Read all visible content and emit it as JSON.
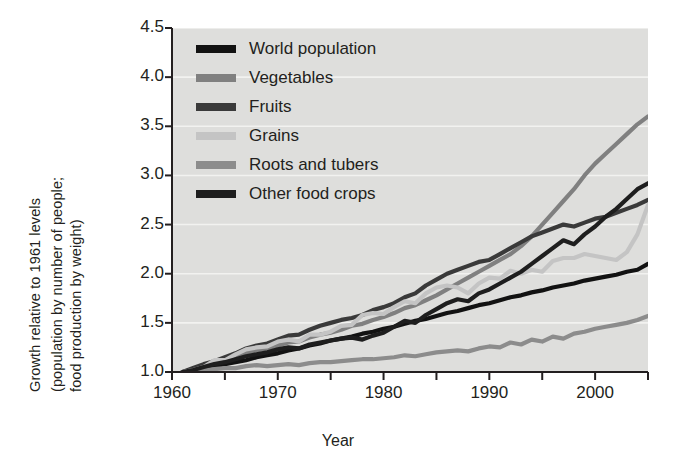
{
  "chart_data": {
    "type": "line",
    "title": "",
    "xlabel": "Year",
    "ylabel": "Growth relative to 1961 levels (population by number of people; food production by weight)",
    "ylabel_lines": [
      "Growth relative to 1961 levels",
      "(population by number of people;",
      "food production by weight)"
    ],
    "xlim": [
      1960,
      2005
    ],
    "ylim": [
      1.0,
      4.5
    ],
    "xticks": [
      1960,
      1970,
      1980,
      1990,
      2000
    ],
    "xtick_labels": [
      "1960",
      "1970",
      "1980",
      "1990",
      "2000"
    ],
    "xminor_ticks": [
      1965,
      1975,
      1985,
      1995,
      2005
    ],
    "yticks": [
      1.0,
      1.5,
      2.0,
      2.5,
      3.0,
      3.5,
      4.0,
      4.5
    ],
    "ytick_labels": [
      "1.0",
      "1.5",
      "2.0",
      "2.5",
      "3.0",
      "3.5",
      "4.0",
      "4.5"
    ],
    "grid": "horizontal-white",
    "legend_position": "top-left-inside",
    "plot_background": "#dededc",
    "x": [
      1961,
      1962,
      1963,
      1964,
      1965,
      1966,
      1967,
      1968,
      1969,
      1970,
      1971,
      1972,
      1973,
      1974,
      1975,
      1976,
      1977,
      1978,
      1979,
      1980,
      1981,
      1982,
      1983,
      1984,
      1985,
      1986,
      1987,
      1988,
      1989,
      1990,
      1991,
      1992,
      1993,
      1994,
      1995,
      1996,
      1997,
      1998,
      1999,
      2000,
      2001,
      2002,
      2003,
      2004,
      2005
    ],
    "series": [
      {
        "name": "World population",
        "color": "#121212",
        "values": [
          1.0,
          1.02,
          1.04,
          1.06,
          1.08,
          1.1,
          1.12,
          1.15,
          1.17,
          1.19,
          1.22,
          1.24,
          1.27,
          1.29,
          1.32,
          1.34,
          1.36,
          1.39,
          1.41,
          1.44,
          1.46,
          1.49,
          1.52,
          1.54,
          1.57,
          1.6,
          1.62,
          1.65,
          1.68,
          1.7,
          1.73,
          1.76,
          1.78,
          1.81,
          1.83,
          1.86,
          1.88,
          1.9,
          1.93,
          1.95,
          1.97,
          1.99,
          2.02,
          2.04,
          2.1
        ]
      },
      {
        "name": "Vegetables",
        "color": "#808080",
        "values": [
          1.0,
          1.03,
          1.06,
          1.1,
          1.13,
          1.15,
          1.2,
          1.22,
          1.24,
          1.27,
          1.3,
          1.31,
          1.35,
          1.38,
          1.4,
          1.43,
          1.47,
          1.49,
          1.53,
          1.56,
          1.6,
          1.65,
          1.68,
          1.73,
          1.78,
          1.84,
          1.9,
          1.96,
          2.02,
          2.08,
          2.14,
          2.2,
          2.28,
          2.38,
          2.5,
          2.62,
          2.74,
          2.86,
          3.0,
          3.12,
          3.22,
          3.32,
          3.42,
          3.52,
          3.6
        ]
      },
      {
        "name": "Fruits",
        "color": "#3a3a3a",
        "values": [
          1.0,
          1.04,
          1.08,
          1.11,
          1.15,
          1.19,
          1.24,
          1.27,
          1.29,
          1.33,
          1.37,
          1.38,
          1.43,
          1.47,
          1.5,
          1.53,
          1.55,
          1.58,
          1.63,
          1.66,
          1.7,
          1.76,
          1.8,
          1.88,
          1.94,
          2.0,
          2.04,
          2.08,
          2.12,
          2.14,
          2.2,
          2.26,
          2.32,
          2.38,
          2.42,
          2.46,
          2.5,
          2.48,
          2.52,
          2.56,
          2.58,
          2.62,
          2.66,
          2.7,
          2.75
        ]
      },
      {
        "name": "Grains",
        "color": "#c4c4c4",
        "values": [
          1.0,
          1.02,
          1.05,
          1.12,
          1.12,
          1.18,
          1.23,
          1.25,
          1.26,
          1.31,
          1.33,
          1.31,
          1.38,
          1.38,
          1.41,
          1.47,
          1.48,
          1.58,
          1.6,
          1.59,
          1.66,
          1.72,
          1.7,
          1.8,
          1.86,
          1.88,
          1.86,
          1.8,
          1.9,
          1.96,
          1.95,
          2.03,
          2.0,
          2.04,
          2.02,
          2.13,
          2.16,
          2.16,
          2.2,
          2.18,
          2.16,
          2.14,
          2.22,
          2.4,
          2.7
        ]
      },
      {
        "name": "Roots and tubers",
        "color": "#8c8c8c",
        "values": [
          1.0,
          1.01,
          1.02,
          1.03,
          1.04,
          1.04,
          1.06,
          1.07,
          1.06,
          1.07,
          1.08,
          1.07,
          1.09,
          1.1,
          1.1,
          1.11,
          1.12,
          1.13,
          1.13,
          1.14,
          1.15,
          1.17,
          1.16,
          1.18,
          1.2,
          1.21,
          1.22,
          1.21,
          1.24,
          1.26,
          1.25,
          1.3,
          1.28,
          1.33,
          1.31,
          1.36,
          1.34,
          1.39,
          1.41,
          1.44,
          1.46,
          1.48,
          1.5,
          1.53,
          1.57
        ]
      },
      {
        "name": "Other food crops",
        "color": "#1e1e1e",
        "values": [
          1.0,
          1.02,
          1.05,
          1.08,
          1.1,
          1.13,
          1.16,
          1.18,
          1.2,
          1.23,
          1.25,
          1.24,
          1.28,
          1.3,
          1.32,
          1.34,
          1.35,
          1.33,
          1.37,
          1.4,
          1.46,
          1.52,
          1.5,
          1.58,
          1.64,
          1.7,
          1.74,
          1.72,
          1.8,
          1.84,
          1.9,
          1.96,
          2.02,
          2.1,
          2.18,
          2.26,
          2.34,
          2.3,
          2.4,
          2.48,
          2.58,
          2.66,
          2.76,
          2.86,
          2.92
        ]
      }
    ]
  },
  "legend": {
    "items": [
      {
        "label": "World population",
        "color": "#121212"
      },
      {
        "label": "Vegetables",
        "color": "#808080"
      },
      {
        "label": "Fruits",
        "color": "#3a3a3a"
      },
      {
        "label": "Grains",
        "color": "#c4c4c4"
      },
      {
        "label": "Roots and tubers",
        "color": "#8c8c8c"
      },
      {
        "label": "Other food crops",
        "color": "#1e1e1e"
      }
    ]
  }
}
